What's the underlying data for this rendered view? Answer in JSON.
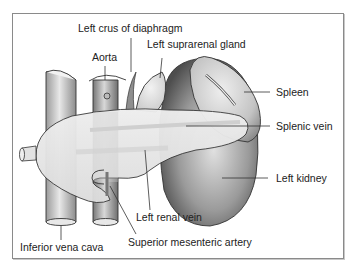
{
  "diagram": {
    "type": "anatomical-illustration",
    "labels": {
      "left_crus": "Left crus of diaphragm",
      "aorta": "Aorta",
      "left_suprarenal": "Left suprarenal gland",
      "spleen": "Spleen",
      "splenic_vein": "Splenic vein",
      "left_kidney": "Left kidney",
      "left_renal_vein": "Left renal vein",
      "sma": "Superior mesenteric artery",
      "ivc": "Inferior vena cava"
    },
    "colors": {
      "frame": "#8a8a8a",
      "outline": "#333333",
      "label_text": "#222222",
      "organ_dark": "#6e6e6e",
      "organ_light": "#d9d9d9",
      "pancreas": "#e6e6e6"
    }
  }
}
